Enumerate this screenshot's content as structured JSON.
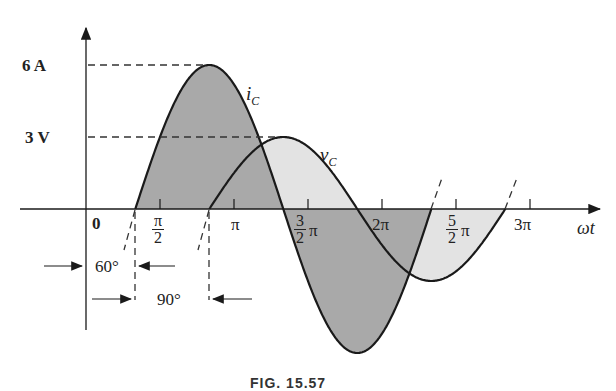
{
  "figure": {
    "caption": "FIG. 15.57",
    "y_labels": {
      "current_peak": "6 A",
      "voltage_peak": "3 V"
    },
    "curve_labels": {
      "current": "i",
      "current_sub": "C",
      "voltage": "v",
      "voltage_sub": "C"
    },
    "x_axis_label": "ωt",
    "origin_label": "0",
    "tick_labels": {
      "half_pi_num": "π",
      "half_pi_den": "2",
      "pi": "π",
      "three_half_num": "3",
      "three_half_den": "2",
      "three_half_suffix": "π",
      "two_pi": "2π",
      "five_half_num": "5",
      "five_half_den": "2",
      "five_half_suffix": "π",
      "three_pi": "3π"
    },
    "phase_annotations": {
      "current_shift": "60°",
      "voltage_lag": "90°"
    },
    "colors": {
      "current_fill": "#a9a9a9",
      "voltage_fill": "#e0e0e0",
      "line": "#1a1a1a"
    }
  },
  "chart_data": {
    "type": "line",
    "title": "",
    "xlabel": "ωt",
    "ylabel": "",
    "x_ticks": [
      "0",
      "π/2",
      "π",
      "3π/2",
      "2π",
      "5π/2",
      "3π"
    ],
    "series": [
      {
        "name": "i_C",
        "amplitude": 6,
        "unit": "A",
        "phase_shift_deg": 60,
        "shading": "dark"
      },
      {
        "name": "v_C",
        "amplitude": 3,
        "unit": "V",
        "phase_shift_deg": 150,
        "shading": "light"
      }
    ],
    "annotations": [
      "60° (i_C start from origin)",
      "90° (v_C lags i_C)"
    ],
    "grid": false
  }
}
